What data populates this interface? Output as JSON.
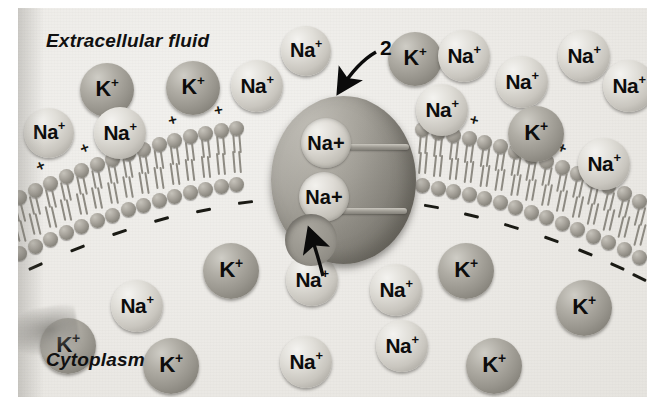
{
  "figure": {
    "type": "biology-diagram"
  },
  "labels": {
    "extracellular": "Extracellular fluid",
    "cytoplasm": "Cytoplasm",
    "step_number": "2"
  },
  "ion_text": {
    "sodium": "Na",
    "potassium": "K",
    "charge": "+"
  },
  "colors": {
    "background": "#eceae6",
    "sodium_fill": "#dedbd5",
    "potassium_fill": "#a8a59d",
    "membrane_head": "#a8a49c",
    "pump_body": "#8e8b83",
    "text": "#101010"
  },
  "membrane": {
    "outer_charge_symbol": "+",
    "inner_charge_symbol": "-",
    "outer_charges": 11,
    "inner_dashes": 14
  },
  "extracellular_ions": [
    {
      "kind": "K",
      "x": 62,
      "y": 55,
      "d": 54
    },
    {
      "kind": "Na",
      "x": 6,
      "y": 100,
      "d": 50
    },
    {
      "kind": "Na",
      "x": 76,
      "y": 99,
      "d": 52
    },
    {
      "kind": "K",
      "x": 148,
      "y": 53,
      "d": 54
    },
    {
      "kind": "Na",
      "x": 213,
      "y": 52,
      "d": 52
    },
    {
      "kind": "Na",
      "x": 263,
      "y": 18,
      "d": 50
    },
    {
      "kind": "K",
      "x": 370,
      "y": 24,
      "d": 54
    },
    {
      "kind": "Na",
      "x": 420,
      "y": 22,
      "d": 52
    },
    {
      "kind": "Na",
      "x": 398,
      "y": 76,
      "d": 52
    },
    {
      "kind": "Na",
      "x": 478,
      "y": 48,
      "d": 52
    },
    {
      "kind": "Na",
      "x": 540,
      "y": 22,
      "d": 52
    },
    {
      "kind": "Na",
      "x": 585,
      "y": 52,
      "d": 52
    },
    {
      "kind": "K",
      "x": 490,
      "y": 98,
      "d": 56
    },
    {
      "kind": "Na",
      "x": 560,
      "y": 130,
      "d": 52
    }
  ],
  "pump_bound_ions": [
    {
      "kind": "Na",
      "x": 30,
      "y": 22,
      "d": 50
    },
    {
      "kind": "Na",
      "x": 28,
      "y": 76,
      "d": 50
    }
  ],
  "pump_empty_site": {
    "x": 14,
    "y": 118,
    "d": 52
  },
  "cytoplasm_ions": [
    {
      "kind": "Na",
      "x": 268,
      "y": 246,
      "d": 52
    },
    {
      "kind": "K",
      "x": 185,
      "y": 235,
      "d": 56
    },
    {
      "kind": "Na",
      "x": 93,
      "y": 272,
      "d": 52
    },
    {
      "kind": "K",
      "x": 22,
      "y": 310,
      "d": 56
    },
    {
      "kind": "K",
      "x": 125,
      "y": 330,
      "d": 56
    },
    {
      "kind": "Na",
      "x": 352,
      "y": 256,
      "d": 52
    },
    {
      "kind": "K",
      "x": 420,
      "y": 235,
      "d": 56
    },
    {
      "kind": "Na",
      "x": 262,
      "y": 328,
      "d": 52
    },
    {
      "kind": "K",
      "x": 448,
      "y": 330,
      "d": 56
    },
    {
      "kind": "Na",
      "x": 358,
      "y": 312,
      "d": 52
    },
    {
      "kind": "K",
      "x": 538,
      "y": 272,
      "d": 56
    }
  ]
}
